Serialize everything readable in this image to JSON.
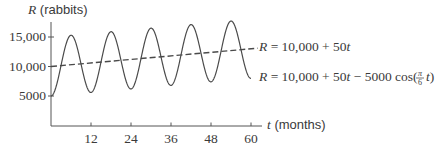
{
  "chart_data": {
    "type": "line",
    "title": "",
    "ylabel_var": "R",
    "ylabel_unit": " (rabbits)",
    "xlabel_var": "t",
    "xlabel_unit": " (months)",
    "xlim": [
      0,
      62
    ],
    "ylim": [
      0,
      18000
    ],
    "x_ticks": [
      12,
      24,
      36,
      48,
      60
    ],
    "x_tick_labels": [
      "12",
      "24",
      "36",
      "48",
      "60"
    ],
    "y_ticks": [
      5000,
      10000,
      15000
    ],
    "y_tick_labels": [
      "5000",
      "10,000",
      "15,000"
    ],
    "grid": false,
    "series": [
      {
        "name": "R = 10,000 + 50t",
        "style": "dashed",
        "formula": "10000 + 50*t",
        "x": [
          0,
          60
        ],
        "values": [
          10000,
          13000
        ]
      },
      {
        "name": "R = 10,000 + 50t − 5000 cos(π/6 t)",
        "style": "solid",
        "formula": "10000 + 50*t - 5000*cos(pi/6*t)",
        "x": [
          0,
          6,
          12,
          18,
          24,
          30,
          36,
          42,
          48,
          54,
          60
        ],
        "values": [
          5000,
          15300,
          5600,
          15900,
          6200,
          16500,
          6800,
          17100,
          7400,
          17700,
          8000
        ]
      }
    ],
    "annotations": [
      {
        "text_lhs": "R",
        "text_rhs": " = 10,000 + 50",
        "text_var": "t",
        "target": "dashed"
      },
      {
        "text_lhs": "R",
        "text_rhs": " = 10,000 + 50",
        "text_var": "t",
        "text_tail": " − 5000 cos(",
        "frac_num": "π",
        "frac_den": "6",
        "tail_var": "t",
        "tail_close": ")",
        "target": "solid"
      }
    ]
  },
  "colors": {
    "line": "#4a4a4a",
    "axis": "#555555",
    "text": "#3a3a3a"
  }
}
